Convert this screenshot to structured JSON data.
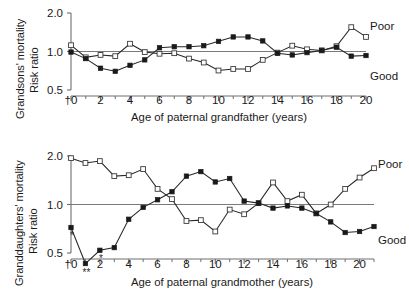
{
  "figure": {
    "background": "#ffffff",
    "marker_colors": {
      "poor_open_square_fill": "#ffffff",
      "poor_open_square_stroke": "#3a3a3a",
      "good_filled_square": "#1a1a1a",
      "line": "#262626",
      "axis": "#6e6e6e",
      "reference_line": "#7a7a7a"
    }
  },
  "chart_data": [
    {
      "id": "grandsons",
      "type": "line",
      "title": "",
      "ylabel_line1": "Grandsons' mortality",
      "ylabel_line2": "Risk ratio",
      "xlabel": "Age of paternal grandfather (years)",
      "ylim": [
        0.5,
        2.0
      ],
      "yscale": "log",
      "yticks": [
        0.5,
        1.0,
        2.0
      ],
      "ytick_labels": [
        "0.5",
        "1.0",
        "2.0"
      ],
      "xlim": [
        0,
        20
      ],
      "xticks": [
        0,
        2,
        4,
        6,
        8,
        10,
        12,
        14,
        16,
        18,
        20
      ],
      "xtick_labels": [
        "†0",
        "2",
        "4",
        "6",
        "8",
        "10",
        "12",
        "14",
        "16",
        "18",
        "20"
      ],
      "xtick_minor_step": 1,
      "grid": false,
      "reference_line_y": 1.0,
      "legend_position": "right-inline",
      "x": [
        0,
        1,
        2,
        3,
        4,
        5,
        6,
        7,
        8,
        9,
        10,
        11,
        12,
        13,
        14,
        15,
        16,
        17,
        18,
        19,
        20
      ],
      "series": [
        {
          "name": "Poor",
          "marker": "open-square",
          "label": "Poor",
          "values": [
            1.12,
            0.9,
            0.94,
            0.92,
            1.15,
            0.99,
            0.96,
            0.97,
            0.88,
            0.82,
            0.71,
            0.73,
            0.73,
            0.86,
            0.98,
            1.11,
            1.04,
            1.02,
            1.1,
            1.55,
            1.3
          ]
        },
        {
          "name": "Good",
          "marker": "filled-square",
          "label": "Good",
          "values": [
            0.99,
            0.88,
            0.74,
            0.7,
            0.78,
            0.86,
            1.07,
            1.09,
            1.09,
            1.11,
            1.2,
            1.3,
            1.3,
            1.21,
            0.97,
            0.94,
            0.98,
            1.02,
            1.08,
            0.92,
            0.93
          ]
        }
      ],
      "annotations": []
    },
    {
      "id": "granddaughters",
      "type": "line",
      "title": "",
      "ylabel_line1": "Granddaughters' mortality",
      "ylabel_line2": "Risk ratio",
      "xlabel": "Age of paternal grandmother (years)",
      "ylim": [
        0.5,
        2.0
      ],
      "yscale": "log",
      "yticks": [
        0.5,
        1.0,
        2.0
      ],
      "ytick_labels": [
        "0.5",
        "1.0",
        "2.0"
      ],
      "xlim": [
        0,
        21
      ],
      "xticks": [
        0,
        2,
        4,
        6,
        8,
        10,
        12,
        14,
        16,
        18,
        20
      ],
      "xtick_labels": [
        "†0",
        "2",
        "4",
        "6",
        "8",
        "10",
        "12",
        "14",
        "16",
        "18",
        "20"
      ],
      "xtick_minor_step": 1,
      "grid": false,
      "reference_line_y": 1.0,
      "legend_position": "right-inline",
      "x": [
        0,
        1,
        2,
        3,
        4,
        5,
        6,
        7,
        8,
        9,
        10,
        11,
        12,
        13,
        14,
        15,
        16,
        17,
        18,
        19,
        20,
        21
      ],
      "series": [
        {
          "name": "Poor",
          "marker": "open-square",
          "label": "Poor",
          "values": [
            1.94,
            1.81,
            1.86,
            1.5,
            1.52,
            1.66,
            1.25,
            1.08,
            0.79,
            0.8,
            0.68,
            0.93,
            0.87,
            1.02,
            1.37,
            1.05,
            1.15,
            0.88,
            1.0,
            1.25,
            1.47,
            1.68
          ]
        },
        {
          "name": "Good",
          "marker": "filled-square",
          "label": "Good",
          "values": [
            0.72,
            0.43,
            0.52,
            0.54,
            0.81,
            0.96,
            1.07,
            1.2,
            1.5,
            1.6,
            1.38,
            1.45,
            1.05,
            1.02,
            0.95,
            0.98,
            0.95,
            0.88,
            0.78,
            0.67,
            0.68,
            0.73
          ]
        }
      ],
      "annotations": [
        {
          "text": "*",
          "x": 0,
          "series": "Good",
          "meaning": "significance-marker"
        },
        {
          "text": "**",
          "x": 1,
          "series": "Good",
          "meaning": "significance-marker"
        },
        {
          "text": "*",
          "x": 2,
          "series": "Good",
          "meaning": "significance-marker"
        }
      ]
    }
  ]
}
